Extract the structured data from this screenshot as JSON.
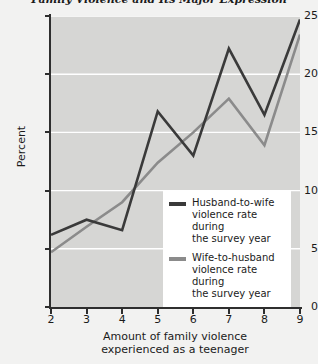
{
  "figure": {
    "title": "Family Violence and Its Major Expression",
    "background_color": "#f2f2f1",
    "plot_background_color": "#d6d6d4",
    "gridline_color": "#ffffff",
    "axis_color": "#2e2e2e"
  },
  "chart_data": {
    "type": "line",
    "title": "Family Violence and Its Major Expression",
    "xlabel_line1": "Amount of family violence",
    "xlabel_line2": "experienced as a teenager",
    "ylabel": "Percent",
    "x": [
      2,
      3,
      4,
      5,
      6,
      7,
      8,
      9
    ],
    "xlim": [
      2,
      9
    ],
    "ylim": [
      0,
      25
    ],
    "xticks": [
      2,
      3,
      4,
      5,
      6,
      7,
      8,
      9
    ],
    "yticks": [
      0,
      5,
      10,
      15,
      20,
      25
    ],
    "xtick_labels": [
      "2",
      "3",
      "4",
      "5",
      "6",
      "7",
      "8",
      "9"
    ],
    "ytick_labels": [
      "0",
      "5",
      "10",
      "15",
      "20",
      "25"
    ],
    "grid": true,
    "grid_axis": "y",
    "legend_position": "lower right",
    "series": [
      {
        "name": "Husband-to-wife violence rate during the survey year",
        "legend_line1": "Husband-to-wife",
        "legend_line2": "violence rate during",
        "legend_line3": "the survey year",
        "color": "#3a3a3a",
        "linewidth": 2.6,
        "values": [
          6.2,
          7.5,
          6.6,
          16.8,
          13.0,
          22.2,
          16.5,
          24.7
        ]
      },
      {
        "name": "Wife-to-husband violence rate during the survey year",
        "legend_line1": "Wife-to-husband",
        "legend_line2": "violence rate during",
        "legend_line3": "the survey year",
        "color": "#8b8b8b",
        "linewidth": 2.6,
        "values": [
          4.7,
          6.9,
          9.0,
          12.4,
          15.0,
          17.9,
          13.9,
          23.4
        ]
      }
    ]
  }
}
